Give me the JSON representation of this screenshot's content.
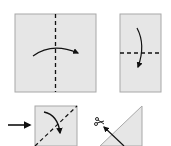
{
  "diagram": {
    "colors": {
      "paper": "#e6e6e6",
      "paper_edge": "#a8a8a8",
      "ink": "#111111"
    },
    "steps": [
      {
        "id": 1,
        "shape": "square",
        "fold_line": "vertical-dashed",
        "arrow": "curved-right",
        "label": "Fold in half vertically"
      },
      {
        "id": 2,
        "shape": "rectangle",
        "fold_line": "horizontal-dashed",
        "arrow": "curved-down",
        "label": "Fold in half downward"
      },
      {
        "id": 3,
        "shape": "small-square",
        "fold_line": "diagonal-dashed",
        "arrow": "curved-down",
        "label": "Fold along diagonal",
        "pointer": "arrow-right"
      },
      {
        "id": 4,
        "shape": "triangle",
        "cut_line": "diagonal",
        "icon": "scissors",
        "label": "Cut along line"
      }
    ]
  }
}
